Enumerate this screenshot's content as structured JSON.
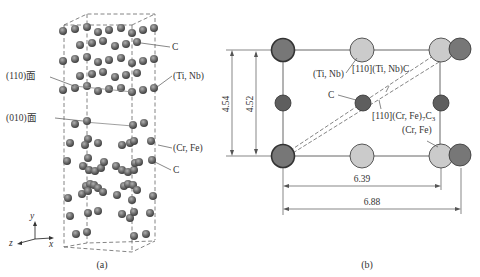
{
  "panel_a": {
    "caption": "(a)",
    "labels": {
      "c_top": "C",
      "plane_110": "(110)面",
      "ti_nb": "(Ti, Nb)",
      "plane_010": "(010)面",
      "cr_fe": "(Cr, Fe)",
      "c_bottom": "C"
    },
    "axes": {
      "x": "x",
      "y": "y",
      "z": "z"
    }
  },
  "panel_b": {
    "caption": "(b)",
    "labels": {
      "ti_nb": "(Ti, Nb)",
      "dir_tinbc": "[110](Ti, Nb)C",
      "c": "C",
      "dir_crfe_pre": "[110](Cr, Fe)",
      "dir_crfe_sub1": "7",
      "dir_crfe_mid": "C",
      "dir_crfe_sub2": "3",
      "cr_fe": "(Cr, Fe)"
    },
    "dimensions": {
      "height_outer": "4.54",
      "height_inner": "4.52",
      "width_inner": "6.39",
      "width_outer": "6.88"
    }
  },
  "colors": {
    "dark_atom": "#6a6a6a",
    "light_atom": "#c8c8c8",
    "line": "#555555"
  }
}
